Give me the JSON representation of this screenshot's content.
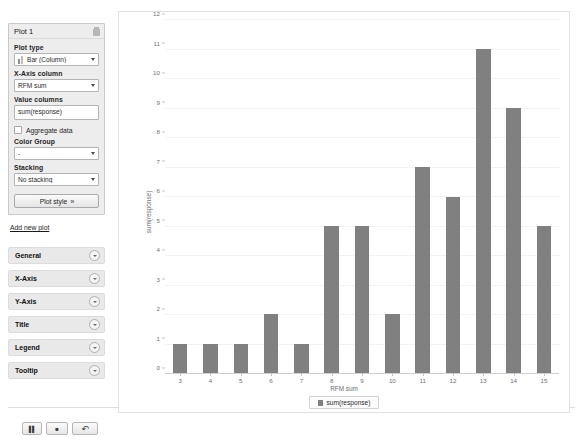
{
  "sidebar": {
    "plot_panel": {
      "title": "Plot 1",
      "delete_icon": "trash-icon",
      "fields": {
        "plot_type_label": "Plot type",
        "plot_type_value": "Bar (Column)",
        "x_axis_label": "X-Axis column",
        "x_axis_value": "RFM sum",
        "value_columns_label": "Value columns",
        "value_columns_value": "sum(response)",
        "aggregate_label": "Aggregate data",
        "aggregate_checked": false,
        "color_group_label": "Color Group",
        "color_group_value": "-",
        "stacking_label": "Stacking",
        "stacking_value": "No stacking"
      },
      "plot_style_button": "Plot style",
      "plot_style_chevron": "»"
    },
    "add_new_plot": "Add new plot",
    "sections": [
      {
        "label": "General",
        "icon": "chevron-down-circle-icon"
      },
      {
        "label": "X-Axis",
        "icon": "chevron-down-circle-icon"
      },
      {
        "label": "Y-Axis",
        "icon": "chevron-down-circle-icon"
      },
      {
        "label": "Title",
        "icon": "chevron-down-circle-icon"
      },
      {
        "label": "Legend",
        "icon": "chevron-down-circle-icon"
      },
      {
        "label": "Tooltip",
        "icon": "chevron-down-circle-icon"
      }
    ],
    "bottom_toolbar": [
      {
        "name": "pause-button",
        "glyph": "▐▌"
      },
      {
        "name": "stop-button",
        "glyph": "■"
      },
      {
        "name": "undo-button",
        "glyph": "↶"
      }
    ]
  },
  "chart_data": {
    "type": "bar",
    "title": "",
    "categories": [
      "3",
      "4",
      "5",
      "6",
      "7",
      "8",
      "9",
      "10",
      "11",
      "12",
      "13",
      "14",
      "15"
    ],
    "values": [
      1,
      1,
      1,
      2,
      1,
      5,
      5,
      2,
      7,
      6,
      11,
      9,
      5
    ],
    "series": [
      {
        "name": "sum(response)",
        "values": [
          1,
          1,
          1,
          2,
          1,
          5,
          5,
          2,
          7,
          6,
          11,
          9,
          5
        ]
      }
    ],
    "xlabel": "RFM sum",
    "ylabel": "sum(response)",
    "ylim": [
      0,
      12
    ],
    "yticks": [
      0,
      1,
      2,
      3,
      4,
      5,
      6,
      7,
      8,
      9,
      10,
      11,
      12
    ],
    "grid": true,
    "legend_position": "bottom",
    "bar_color": "#808080"
  }
}
